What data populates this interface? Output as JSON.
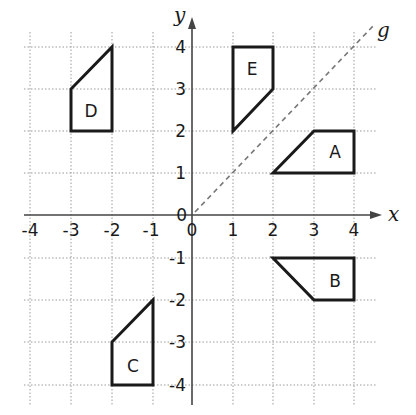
{
  "diagram": {
    "type": "coordinate-grid-reflection",
    "axes": {
      "x_label": "x",
      "y_label": "y",
      "origin_label": "0",
      "x_ticks": [
        "-4",
        "-3",
        "-2",
        "-1",
        "0",
        "1",
        "2",
        "3",
        "4"
      ],
      "y_ticks": [
        "4",
        "3",
        "2",
        "1",
        "-1",
        "-2",
        "-3",
        "-4"
      ],
      "x_range": [
        -4,
        4
      ],
      "y_range": [
        -4,
        4
      ]
    },
    "mirror_line": {
      "label": "g",
      "equation": "y = x",
      "style": "dashed",
      "color": "#777777"
    },
    "shapes": [
      {
        "label": "A",
        "vertices": [
          [
            2,
            1
          ],
          [
            4,
            1
          ],
          [
            4,
            2
          ],
          [
            3,
            2
          ]
        ]
      },
      {
        "label": "B",
        "vertices": [
          [
            2,
            -1
          ],
          [
            4,
            -1
          ],
          [
            4,
            -2
          ],
          [
            3,
            -2
          ]
        ]
      },
      {
        "label": "C",
        "vertices": [
          [
            -2,
            -4
          ],
          [
            -1,
            -4
          ],
          [
            -1,
            -2
          ],
          [
            -2,
            -3
          ]
        ]
      },
      {
        "label": "D",
        "vertices": [
          [
            -3,
            2
          ],
          [
            -2,
            2
          ],
          [
            -2,
            4
          ],
          [
            -3,
            3
          ]
        ]
      },
      {
        "label": "E",
        "vertices": [
          [
            1,
            4
          ],
          [
            2,
            4
          ],
          [
            2,
            3
          ],
          [
            1,
            2
          ]
        ]
      }
    ],
    "colors": {
      "shape_stroke": "#1a1a1a",
      "grid": "#9a9a9a",
      "axis": "#444444",
      "background": "#ffffff"
    }
  }
}
